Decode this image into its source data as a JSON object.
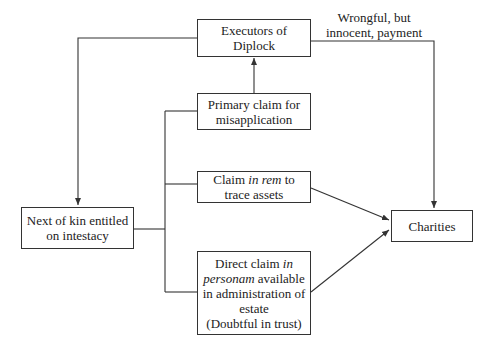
{
  "diagram": {
    "nodes": {
      "executors": {
        "line1": "Executors of",
        "line2": "Diplock"
      },
      "primary": {
        "line1": "Primary claim for",
        "line2": "misapplication"
      },
      "in_rem": {
        "line1_pre": "Claim ",
        "line1_italic": "in rem",
        "line1_post": " to",
        "line2": "trace assets"
      },
      "next_of_kin": {
        "line1": "Next of kin entitled",
        "line2": "on intestacy"
      },
      "in_personam": {
        "line1_pre": "Direct claim ",
        "line1_italic": "in",
        "line2_italic": "personam",
        "line2_post": " available",
        "line3": "in administration of",
        "line4": "estate",
        "line5": "(Doubtful in trust)"
      },
      "charities": {
        "label": "Charities"
      }
    },
    "edge_labels": {
      "wrongful": {
        "line1": "Wrongful, but",
        "line2": "innocent, payment"
      }
    },
    "colors": {
      "stroke": "#333333",
      "background": "#ffffff"
    }
  }
}
